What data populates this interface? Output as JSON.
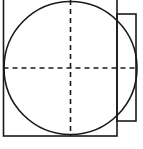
{
  "figure": {
    "type": "line-drawing",
    "canvas": {
      "width": 143,
      "height": 149,
      "background": "#ffffff"
    },
    "stroke": {
      "color": "#1a1a1a",
      "solid_width": 1.6,
      "dashed_width": 1.6,
      "dash_pattern": "5 4"
    },
    "shapes": {
      "square": {
        "name": "large-square",
        "x": 3.5,
        "y": -4,
        "width": 113.5,
        "height": 140,
        "fill": "none"
      },
      "circle": {
        "name": "main-circle",
        "cx": 70.5,
        "cy": 68,
        "r": 66.5,
        "fill": "none"
      },
      "rectangle": {
        "name": "side-rectangle",
        "x": 117,
        "y": 14,
        "width": 19,
        "height": 107,
        "fill": "none"
      },
      "horizontal_axis": {
        "name": "horizontal-center-line",
        "x1": 3.5,
        "y1": 68,
        "x2": 136,
        "y2": 68
      },
      "vertical_axis": {
        "name": "vertical-center-line",
        "x1": 70.5,
        "y1": 0,
        "x2": 70.5,
        "y2": 136
      }
    },
    "labels": {
      "caption": ""
    }
  }
}
